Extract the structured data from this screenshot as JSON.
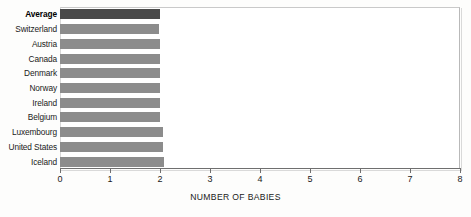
{
  "chart_data": {
    "type": "bar",
    "orientation": "horizontal",
    "title": "",
    "xlabel": "NUMBER OF BABIES",
    "ylabel": "",
    "xlim": [
      0,
      8
    ],
    "xticks": [
      "0",
      "1",
      "2",
      "3",
      "4",
      "5",
      "6",
      "7",
      "8"
    ],
    "grid": false,
    "legend": null,
    "categories": [
      "Average",
      "Switzerland",
      "Austria",
      "Canada",
      "Denmark",
      "Norway",
      "Ireland",
      "Belgium",
      "Luxembourg",
      "United States",
      "Iceland"
    ],
    "values": [
      2.0,
      1.98,
      2.0,
      2.0,
      2.0,
      2.0,
      2.0,
      2.0,
      2.05,
      2.05,
      2.07
    ],
    "highlight_category": "Average",
    "colors": {
      "bar": "#8c8c8c",
      "highlight_bar": "#4a4a4a",
      "axis": "#6f6f6f",
      "frame": "#b9b9b9",
      "text": "#1a1a1a",
      "background": "#fdfdfc"
    }
  }
}
